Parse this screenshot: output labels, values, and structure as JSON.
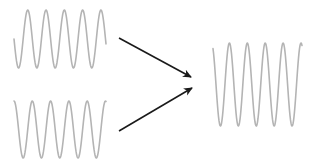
{
  "diagram": {
    "colors": {
      "wave": "#b4b4b4",
      "arrow": "#1a1a1a",
      "background": "#ffffff"
    },
    "waves": [
      {
        "name": "input-wave-top",
        "x_start": 14,
        "x_end": 106,
        "y_center": 39,
        "amplitude": 29,
        "period": 18.3,
        "phase_deg": 180
      },
      {
        "name": "input-wave-bottom",
        "x_start": 14,
        "x_end": 106,
        "y_center": 129.5,
        "amplitude": 28.5,
        "period": 18.3,
        "phase_deg": 90
      },
      {
        "name": "output-wave",
        "x_start": 213,
        "x_end": 302,
        "y_center": 84.5,
        "amplitude": 41.5,
        "period": 17.9,
        "phase_deg": 120
      }
    ],
    "arrows": [
      {
        "name": "arrow-top",
        "x1": 119,
        "y1": 38,
        "x2": 191,
        "y2": 77
      },
      {
        "name": "arrow-bottom",
        "x1": 119,
        "y1": 131,
        "x2": 192,
        "y2": 88
      }
    ]
  }
}
